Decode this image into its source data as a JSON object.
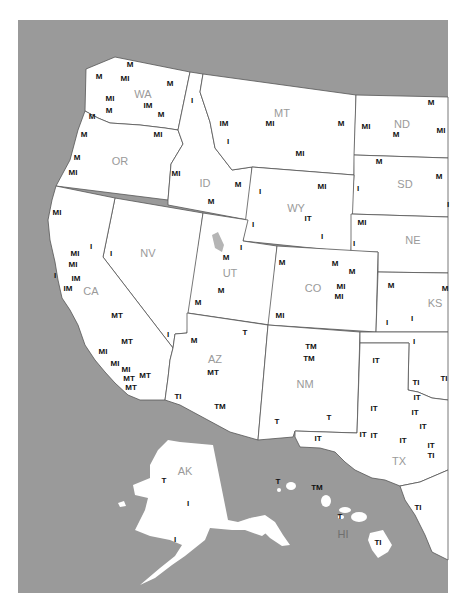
{
  "map": {
    "colors": {
      "water": "#9a9a9a",
      "land": "#ffffff",
      "border": "#555555",
      "state_label": "#9a9a9a",
      "code_label": "#111111"
    },
    "states": [
      {
        "abbr": "WA",
        "x": 143,
        "y": 98
      },
      {
        "abbr": "OR",
        "x": 120,
        "y": 165
      },
      {
        "abbr": "ID",
        "x": 205,
        "y": 187
      },
      {
        "abbr": "MT",
        "x": 282,
        "y": 117
      },
      {
        "abbr": "ND",
        "x": 402,
        "y": 128
      },
      {
        "abbr": "SD",
        "x": 405,
        "y": 188
      },
      {
        "abbr": "WY",
        "x": 296,
        "y": 212
      },
      {
        "abbr": "NE",
        "x": 413,
        "y": 244
      },
      {
        "abbr": "NV",
        "x": 148,
        "y": 257
      },
      {
        "abbr": "UT",
        "x": 230,
        "y": 277
      },
      {
        "abbr": "CO",
        "x": 313,
        "y": 292
      },
      {
        "abbr": "KS",
        "x": 435,
        "y": 307
      },
      {
        "abbr": "CA",
        "x": 91,
        "y": 295
      },
      {
        "abbr": "AZ",
        "x": 215,
        "y": 363
      },
      {
        "abbr": "NM",
        "x": 305,
        "y": 388
      },
      {
        "abbr": "TX",
        "x": 399,
        "y": 465
      },
      {
        "abbr": "AK",
        "x": 185,
        "y": 475
      },
      {
        "abbr": "HI",
        "x": 343,
        "y": 538
      }
    ],
    "codes": [
      {
        "text": "M",
        "x": 130,
        "y": 67
      },
      {
        "text": "M",
        "x": 99,
        "y": 79
      },
      {
        "text": "MI",
        "x": 125,
        "y": 81
      },
      {
        "text": "M",
        "x": 170,
        "y": 86
      },
      {
        "text": "I",
        "x": 192,
        "y": 103
      },
      {
        "text": "MI",
        "x": 110,
        "y": 101
      },
      {
        "text": "IM",
        "x": 148,
        "y": 108
      },
      {
        "text": "M",
        "x": 109,
        "y": 113
      },
      {
        "text": "M",
        "x": 161,
        "y": 117
      },
      {
        "text": "M",
        "x": 92,
        "y": 119
      },
      {
        "text": "M",
        "x": 84,
        "y": 137
      },
      {
        "text": "MI",
        "x": 158,
        "y": 137
      },
      {
        "text": "M",
        "x": 77,
        "y": 160
      },
      {
        "text": "MI",
        "x": 73,
        "y": 175
      },
      {
        "text": "MI",
        "x": 176,
        "y": 176
      },
      {
        "text": "IM",
        "x": 224,
        "y": 126
      },
      {
        "text": "I",
        "x": 228,
        "y": 144
      },
      {
        "text": "MI",
        "x": 270,
        "y": 126
      },
      {
        "text": "M",
        "x": 341,
        "y": 126
      },
      {
        "text": "MI",
        "x": 300,
        "y": 156
      },
      {
        "text": "M",
        "x": 431,
        "y": 105
      },
      {
        "text": "MI",
        "x": 366,
        "y": 129
      },
      {
        "text": "M",
        "x": 396,
        "y": 137
      },
      {
        "text": "MI",
        "x": 441,
        "y": 133
      },
      {
        "text": "M",
        "x": 379,
        "y": 164
      },
      {
        "text": "M",
        "x": 439,
        "y": 179
      },
      {
        "text": "I",
        "x": 358,
        "y": 191
      },
      {
        "text": "I",
        "x": 448,
        "y": 207
      },
      {
        "text": "M",
        "x": 238,
        "y": 187
      },
      {
        "text": "M",
        "x": 211,
        "y": 204
      },
      {
        "text": "I",
        "x": 260,
        "y": 194
      },
      {
        "text": "MI",
        "x": 322,
        "y": 189
      },
      {
        "text": "IT",
        "x": 308,
        "y": 221
      },
      {
        "text": "I",
        "x": 253,
        "y": 227
      },
      {
        "text": "I",
        "x": 322,
        "y": 239
      },
      {
        "text": "MI",
        "x": 362,
        "y": 225
      },
      {
        "text": "I",
        "x": 354,
        "y": 246
      },
      {
        "text": "MI",
        "x": 57,
        "y": 215
      },
      {
        "text": "I",
        "x": 91,
        "y": 249
      },
      {
        "text": "MI",
        "x": 75,
        "y": 256
      },
      {
        "text": "MI",
        "x": 73,
        "y": 267
      },
      {
        "text": "I",
        "x": 55,
        "y": 278
      },
      {
        "text": "IM",
        "x": 76,
        "y": 281
      },
      {
        "text": "IM",
        "x": 68,
        "y": 291
      },
      {
        "text": "I",
        "x": 111,
        "y": 256
      },
      {
        "text": "I",
        "x": 241,
        "y": 250
      },
      {
        "text": "M",
        "x": 226,
        "y": 260
      },
      {
        "text": "M",
        "x": 221,
        "y": 293
      },
      {
        "text": "M",
        "x": 198,
        "y": 305
      },
      {
        "text": "M",
        "x": 282,
        "y": 265
      },
      {
        "text": "M",
        "x": 335,
        "y": 266
      },
      {
        "text": "M",
        "x": 352,
        "y": 274
      },
      {
        "text": "MI",
        "x": 341,
        "y": 289
      },
      {
        "text": "MI",
        "x": 339,
        "y": 299
      },
      {
        "text": "MI",
        "x": 280,
        "y": 318
      },
      {
        "text": "M",
        "x": 391,
        "y": 288
      },
      {
        "text": "M",
        "x": 445,
        "y": 291
      },
      {
        "text": "I",
        "x": 387,
        "y": 325
      },
      {
        "text": "I",
        "x": 412,
        "y": 321
      },
      {
        "text": "MT",
        "x": 117,
        "y": 318
      },
      {
        "text": "I",
        "x": 168,
        "y": 337
      },
      {
        "text": "MT",
        "x": 127,
        "y": 344
      },
      {
        "text": "M",
        "x": 194,
        "y": 343
      },
      {
        "text": "T",
        "x": 245,
        "y": 335
      },
      {
        "text": "MI",
        "x": 103,
        "y": 354
      },
      {
        "text": "MI",
        "x": 115,
        "y": 366
      },
      {
        "text": "MI",
        "x": 126,
        "y": 372
      },
      {
        "text": "MT",
        "x": 145,
        "y": 378
      },
      {
        "text": "MT",
        "x": 129,
        "y": 381
      },
      {
        "text": "MT",
        "x": 131,
        "y": 390
      },
      {
        "text": "MT",
        "x": 213,
        "y": 375
      },
      {
        "text": "TI",
        "x": 178,
        "y": 399
      },
      {
        "text": "TM",
        "x": 220,
        "y": 409
      },
      {
        "text": "TM",
        "x": 311,
        "y": 349
      },
      {
        "text": "TM",
        "x": 309,
        "y": 361
      },
      {
        "text": "T",
        "x": 277,
        "y": 424
      },
      {
        "text": "T",
        "x": 329,
        "y": 420
      },
      {
        "text": "I",
        "x": 414,
        "y": 344
      },
      {
        "text": "IT",
        "x": 376,
        "y": 363
      },
      {
        "text": "TI",
        "x": 416,
        "y": 385
      },
      {
        "text": "TI",
        "x": 444,
        "y": 381
      },
      {
        "text": "IT",
        "x": 417,
        "y": 400
      },
      {
        "text": "IT",
        "x": 374,
        "y": 411
      },
      {
        "text": "IT",
        "x": 415,
        "y": 415
      },
      {
        "text": "IT",
        "x": 423,
        "y": 429
      },
      {
        "text": "IT",
        "x": 318,
        "y": 441
      },
      {
        "text": "IT",
        "x": 363,
        "y": 437
      },
      {
        "text": "IT",
        "x": 374,
        "y": 438
      },
      {
        "text": "IT",
        "x": 403,
        "y": 443
      },
      {
        "text": "IT",
        "x": 431,
        "y": 448
      },
      {
        "text": "TI",
        "x": 431,
        "y": 458
      },
      {
        "text": "T",
        "x": 164,
        "y": 483
      },
      {
        "text": "I",
        "x": 188,
        "y": 506
      },
      {
        "text": "I",
        "x": 175,
        "y": 542
      },
      {
        "text": "T",
        "x": 278,
        "y": 484
      },
      {
        "text": "TM",
        "x": 317,
        "y": 490
      },
      {
        "text": "T",
        "x": 340,
        "y": 519
      },
      {
        "text": "TI",
        "x": 418,
        "y": 510
      },
      {
        "text": "TI",
        "x": 378,
        "y": 545
      }
    ]
  }
}
